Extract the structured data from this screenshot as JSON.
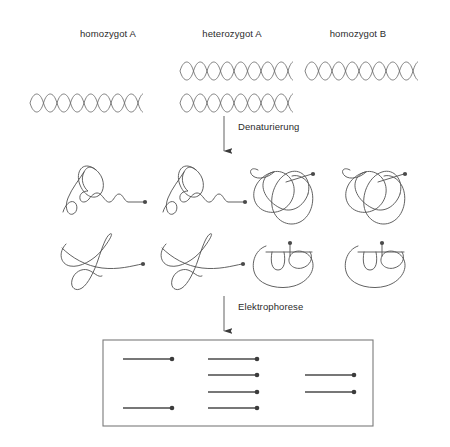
{
  "figure": {
    "background": "#ffffff",
    "ink": "#4a4a4a",
    "text_color": "#2b2b2b"
  },
  "columns": [
    {
      "label": "homozygot A",
      "x": 108,
      "y": 28
    },
    {
      "label": "heterozygot A",
      "x": 232,
      "y": 28
    },
    {
      "label": "homozygot B",
      "x": 358,
      "y": 28
    }
  ],
  "dna_row": {
    "description": "DNA-Doppelhelix",
    "strands": [
      {
        "genotype": "heterozygot A",
        "allele": "A",
        "x": 180,
        "y": 60,
        "width": 112
      },
      {
        "genotype": "homozygot B",
        "allele": "B",
        "x": 305,
        "y": 60,
        "width": 112
      },
      {
        "genotype": "homozygot A",
        "allele": "A",
        "x": 30,
        "y": 92,
        "width": 112
      },
      {
        "genotype": "heterozygot A",
        "allele": "B",
        "x": 180,
        "y": 92,
        "width": 112
      }
    ]
  },
  "steps": [
    {
      "label": "Denaturierung",
      "arrow_x": 224,
      "arrow_top": 116,
      "arrow_bottom": 152,
      "label_x": 238,
      "label_y": 122
    },
    {
      "label": "Elektrophorese",
      "arrow_x": 224,
      "arrow_top": 296,
      "arrow_bottom": 332,
      "label_x": 238,
      "label_y": 302
    }
  ],
  "conformations": {
    "description": "Einzelstraenge mit Sekundaerstruktur",
    "columns": [
      {
        "allele": "A",
        "shape_top": "loop-tail",
        "shape_bottom": "bowtie",
        "cx": 95
      },
      {
        "allele": "A",
        "shape_top": "loop-tail",
        "shape_bottom": "bowtie",
        "cx": 195
      },
      {
        "allele": "B",
        "shape_top": "oval-tangle",
        "shape_bottom": "basket",
        "cx": 290
      },
      {
        "allele": "B",
        "shape_top": "oval-tangle",
        "shape_bottom": "basket",
        "cx": 383
      }
    ]
  },
  "gel": {
    "name": "Elektrophorese-Gel",
    "box": {
      "x": 103,
      "y": 340,
      "width": 270,
      "height": 86
    },
    "border_color": "#7a7a7a",
    "band_color": "#4a4a4a",
    "lanes": [
      {
        "genotype": "homozygot A",
        "band_count": 2,
        "bands": [
          {
            "row": 1,
            "x1": 123,
            "x2": 172,
            "y": 359
          },
          {
            "row": 4,
            "x1": 123,
            "x2": 172,
            "y": 408
          }
        ]
      },
      {
        "genotype": "heterozygot A",
        "band_count": 4,
        "bands": [
          {
            "row": 1,
            "x1": 208,
            "x2": 257,
            "y": 359
          },
          {
            "row": 2,
            "x1": 208,
            "x2": 257,
            "y": 375
          },
          {
            "row": 3,
            "x1": 208,
            "x2": 257,
            "y": 392
          },
          {
            "row": 4,
            "x1": 208,
            "x2": 257,
            "y": 408
          }
        ]
      },
      {
        "genotype": "homozygot B",
        "band_count": 2,
        "bands": [
          {
            "row": 2,
            "x1": 305,
            "x2": 354,
            "y": 375
          },
          {
            "row": 3,
            "x1": 305,
            "x2": 354,
            "y": 392
          }
        ]
      }
    ]
  }
}
